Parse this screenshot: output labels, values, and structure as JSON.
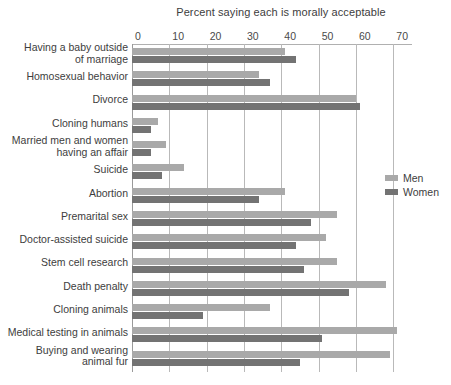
{
  "chart_data": {
    "type": "bar",
    "orientation": "horizontal",
    "title": "Percent saying each is morally acceptable",
    "xlabel": "",
    "ylabel": "",
    "xlim": [
      0,
      75
    ],
    "xticks": [
      0,
      10,
      20,
      30,
      40,
      50,
      60,
      70
    ],
    "grid": true,
    "legend_position": "right-middle",
    "categories": [
      "Having a baby outside\nof marriage",
      "Homosexual behavior",
      "Divorce",
      "Cloning humans",
      "Married men and women\nhaving an affair",
      "Suicide",
      "Abortion",
      "Premarital sex",
      "Doctor-assisted suicide",
      "Stem cell research",
      "Death penalty",
      "Cloning animals",
      "Medical testing in animals",
      "Buying and wearing\nanimal fur"
    ],
    "series": [
      {
        "name": "Men",
        "color": "#a9a9a9",
        "values": [
          41,
          34,
          60,
          7,
          9,
          14,
          41,
          55,
          52,
          55,
          68,
          37,
          71,
          69
        ]
      },
      {
        "name": "Women",
        "color": "#737373",
        "values": [
          44,
          37,
          61,
          5,
          5,
          8,
          34,
          48,
          44,
          46,
          58,
          19,
          51,
          45
        ]
      }
    ]
  },
  "legend": {
    "items": [
      {
        "label": "Men"
      },
      {
        "label": "Women"
      }
    ]
  }
}
